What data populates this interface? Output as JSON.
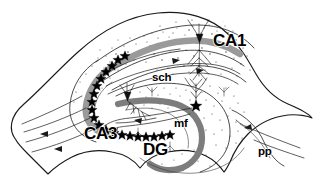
{
  "figure": {
    "background_color": "#ffffff",
    "ink_color": "#111111",
    "cell_layer_color": "#9a9a9a",
    "width": 316,
    "height": 184
  },
  "labels": {
    "ca1": "CA1",
    "ca3": "CA3",
    "dg": "DG",
    "mf": "mf",
    "sch": "sch",
    "pp": "pp"
  },
  "regions": [
    {
      "id": "ca1",
      "label": "CA1",
      "full_name": "Cornu Ammonis area 1",
      "label_x": 213,
      "label_y": 42,
      "size": "major"
    },
    {
      "id": "ca3",
      "label": "CA3",
      "full_name": "Cornu Ammonis area 3",
      "label_x": 84,
      "label_y": 135,
      "size": "major"
    },
    {
      "id": "dg",
      "label": "DG",
      "full_name": "Dentate gyrus",
      "label_x": 143,
      "label_y": 151,
      "size": "major"
    }
  ],
  "pathways": [
    {
      "id": "mf",
      "label": "mf",
      "full_name": "mossy fibers",
      "label_x": 174,
      "label_y": 124,
      "size": "minor"
    },
    {
      "id": "sch",
      "label": "sch",
      "full_name": "Schaffer collaterals",
      "label_x": 152,
      "label_y": 78,
      "size": "minor"
    },
    {
      "id": "pp",
      "label": "pp",
      "full_name": "perforant path",
      "label_x": 258,
      "label_y": 152,
      "size": "minor"
    }
  ],
  "markers": {
    "star_chain_name": "pyramidal-cell-marker-chain",
    "star_count": 27,
    "soma_marker_name": "neuron-soma"
  },
  "neurons": [
    {
      "id": "ca1-pyramidal",
      "region": "CA1",
      "x": 199,
      "y": 40
    },
    {
      "id": "ca3-pyramidal",
      "region": "CA3",
      "x": 128,
      "y": 96
    },
    {
      "id": "dg-granule",
      "region": "DG",
      "x": 196,
      "y": 106
    }
  ]
}
